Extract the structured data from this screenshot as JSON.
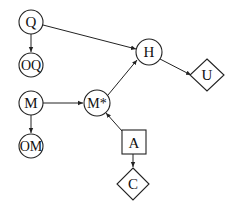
{
  "diagram": {
    "type": "influence-diagram",
    "nodes": [
      {
        "id": "Q",
        "label": "Q",
        "shape": "circle",
        "x": 31,
        "y": 22
      },
      {
        "id": "OQ",
        "label": "OQ",
        "shape": "circle",
        "x": 31,
        "y": 65
      },
      {
        "id": "M",
        "label": "M",
        "shape": "circle",
        "x": 31,
        "y": 103
      },
      {
        "id": "OM",
        "label": "OM",
        "shape": "circle",
        "x": 31,
        "y": 146
      },
      {
        "id": "Mstar",
        "label": "M*",
        "shape": "circle",
        "x": 97,
        "y": 103
      },
      {
        "id": "H",
        "label": "H",
        "shape": "circle",
        "x": 149,
        "y": 52
      },
      {
        "id": "U",
        "label": "U",
        "shape": "diamond",
        "x": 207,
        "y": 75
      },
      {
        "id": "A",
        "label": "A",
        "shape": "square",
        "x": 134,
        "y": 142
      },
      {
        "id": "C",
        "label": "C",
        "shape": "diamond",
        "x": 131,
        "y": 184
      }
    ],
    "edges": [
      {
        "from": "Q",
        "to": "OQ"
      },
      {
        "from": "Q",
        "to": "H"
      },
      {
        "from": "M",
        "to": "OM"
      },
      {
        "from": "M",
        "to": "M*"
      },
      {
        "from": "M*",
        "to": "H"
      },
      {
        "from": "H",
        "to": "U"
      },
      {
        "from": "A",
        "to": "M*"
      },
      {
        "from": "A",
        "to": "C"
      }
    ]
  }
}
